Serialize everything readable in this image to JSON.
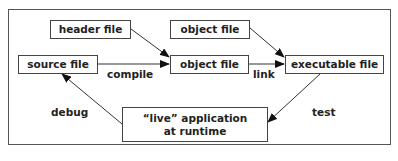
{
  "diagram": {
    "nodes": [
      {
        "id": "header",
        "label": "header file"
      },
      {
        "id": "object_top",
        "label": "object file"
      },
      {
        "id": "source",
        "label": "source file"
      },
      {
        "id": "object_mid",
        "label": "object file"
      },
      {
        "id": "executable",
        "label": "executable file"
      },
      {
        "id": "live_app",
        "label_line1": "“live” application",
        "label_line2": "at runtime"
      }
    ],
    "edges": [
      {
        "from": "header",
        "to": "object_mid",
        "label": ""
      },
      {
        "from": "source",
        "to": "object_mid",
        "label": "compile"
      },
      {
        "from": "object_top",
        "to": "executable",
        "label": ""
      },
      {
        "from": "object_mid",
        "to": "executable",
        "label": "link"
      },
      {
        "from": "executable",
        "to": "live_app",
        "label": "test"
      },
      {
        "from": "live_app",
        "to": "source",
        "label": "debug"
      }
    ],
    "edge_labels": {
      "compile": "compile",
      "link": "link",
      "test": "test",
      "debug": "debug"
    }
  }
}
